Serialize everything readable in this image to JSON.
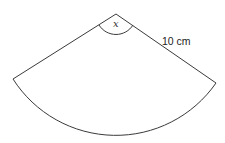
{
  "diagram": {
    "type": "circular-sector",
    "angle_label": "x",
    "radius_label": "10 cm",
    "colors": {
      "stroke": "#3a3a3a",
      "text": "#222222",
      "background": "#ffffff"
    }
  }
}
